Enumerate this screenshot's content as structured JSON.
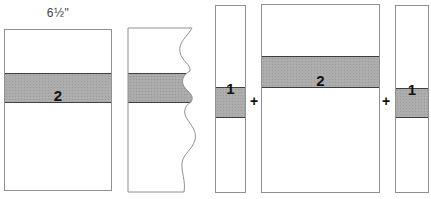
{
  "measurement_label": "6½\"",
  "pieces": {
    "full_strip": {
      "label": "2"
    },
    "torn_strip": {
      "label": ""
    },
    "strip_left": {
      "label": "1"
    },
    "center_rect": {
      "label": "2"
    },
    "strip_right": {
      "label": "1"
    }
  },
  "operators": {
    "plus": "+"
  },
  "colors": {
    "background": "#ffffff",
    "outline": "#909090",
    "band_fill": "#adadad",
    "band_dot": "#9a9a9a",
    "band_edge": "#3f3f3f",
    "label_text": "#111111",
    "measurement_text": "#444444"
  }
}
